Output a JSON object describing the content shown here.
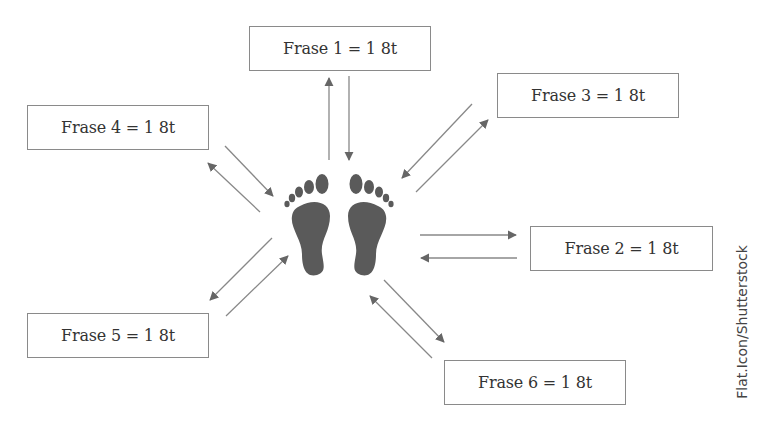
{
  "diagram": {
    "type": "footprint-phrase-diagram",
    "center_icon": "bare-footprints-icon",
    "colors": {
      "footprint": "#5a5a5a",
      "arrow": "#666666",
      "box_border": "#8a8a8a",
      "text": "#333333"
    },
    "phrases": [
      {
        "id": 1,
        "label": "Frase 1 = 1 8t",
        "position": "top"
      },
      {
        "id": 2,
        "label": "Frase 2 = 1 8t",
        "position": "right"
      },
      {
        "id": 3,
        "label": "Frase 3 = 1 8t",
        "position": "upper-right"
      },
      {
        "id": 4,
        "label": "Frase 4 = 1 8t",
        "position": "upper-left"
      },
      {
        "id": 5,
        "label": "Frase 5 = 1 8t",
        "position": "lower-left"
      },
      {
        "id": 6,
        "label": "Frase 6 = 1 8t",
        "position": "lower-right"
      }
    ],
    "arrows": "bidirectional pairs between footprints and each phrase box"
  },
  "credit": "Flat.Icon/Shutterstock"
}
